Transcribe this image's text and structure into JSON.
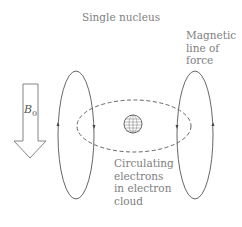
{
  "diagram": {
    "title": "Single nucleus",
    "field_label": "B",
    "field_subscript": "0",
    "magnetic_label_lines": [
      "Magnetic",
      "line of",
      "force"
    ],
    "electron_label_lines": [
      "Circulating",
      "electrons",
      "in electron",
      "cloud"
    ],
    "colors": {
      "line": "#555555",
      "text": "#808080"
    }
  }
}
